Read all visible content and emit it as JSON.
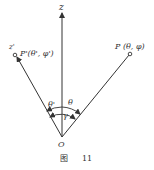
{
  "diagram": {
    "axis_z_label": "z",
    "axis_z_prime_label": "z'",
    "point_P_label": "P (θ, φ)",
    "point_P_prime_label": "P'(θ', φ')",
    "origin_label": "O",
    "angle_theta_label": "θ",
    "angle_theta_prime_label": "θ'",
    "angle_gamma_label": "γ",
    "caption_prefix": "图",
    "caption_number": "11",
    "line_color": "#333333"
  }
}
